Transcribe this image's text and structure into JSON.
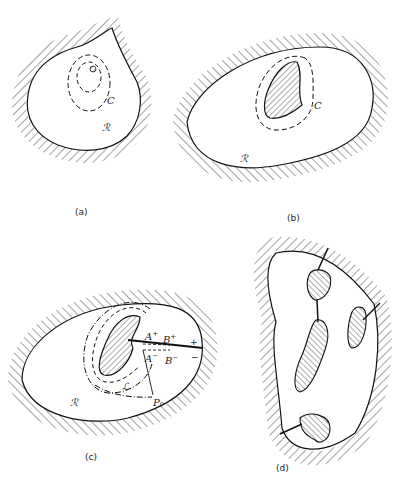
{
  "figure": {
    "panels": [
      {
        "id": "a",
        "caption": "(a)",
        "region_label": "ℛ",
        "curve_label": "C",
        "description": "Simply connected region with a point hole, enclosed by dashed contours C"
      },
      {
        "id": "b",
        "caption": "(b)",
        "region_label": "ℛ",
        "curve_label": "C",
        "description": "Doubly connected region with a hatched hole, contour C encircles hole"
      },
      {
        "id": "c",
        "caption": "(c)",
        "region_label": "ℛ",
        "curve_label": "ℒ",
        "point_label": "P₀",
        "cut_labels": {
          "a_plus": "A",
          "a_minus": "A",
          "b_plus": "B",
          "b_minus": "B",
          "plus_sign": "+",
          "minus_sign": "−",
          "sup_plus": "+",
          "sup_minus": "−"
        },
        "description": "Region with cut from hole to boundary, path ℒ from P₀"
      },
      {
        "id": "d",
        "caption": "(d)",
        "description": "Multiply connected region with four holes connected by cuts"
      }
    ]
  }
}
